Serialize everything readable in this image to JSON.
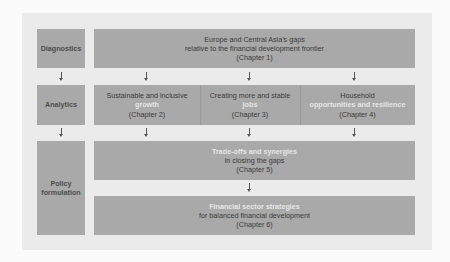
{
  "diagram": {
    "stages": [
      {
        "label": "Diagnostics"
      },
      {
        "label": "Analytics"
      },
      {
        "label": "Policy formulation"
      }
    ],
    "diagnostics": {
      "line1": "Europe and Central Asia’s gaps",
      "line2": "relative to the financial development frontier",
      "chapter": "(Chapter 1)"
    },
    "analytics": [
      {
        "line1": "Sustainable and inclusive",
        "line2": "growth",
        "chapter": "(Chapter 2)"
      },
      {
        "line1": "Creating more and stable",
        "line2": "jobs",
        "chapter": "(Chapter 3)"
      },
      {
        "line1": "Household",
        "line2": "opportunities and resilience",
        "chapter": "(Chapter 4)"
      }
    ],
    "policy": [
      {
        "line1": "Trade-offs and synergies",
        "line2": "in closing the gaps",
        "chapter": "(Chapter 5)"
      },
      {
        "line1": "Financial sector strategies",
        "line2": "for balanced financial development",
        "chapter": "(Chapter 6)"
      }
    ],
    "colors": {
      "page": "#fbfbfb",
      "panel": "#ebebeb",
      "box": "#a9a9a9",
      "text": "#3a3a3a",
      "highlight_text": "#e6e6e6"
    }
  }
}
